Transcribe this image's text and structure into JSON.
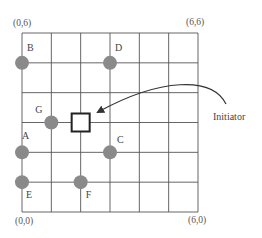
{
  "diagram": {
    "grid": {
      "cols": 6,
      "rows": 6,
      "left": 22,
      "top": 33,
      "right": 198,
      "bottom": 212,
      "line_color": "#555555"
    },
    "corners": {
      "top_left": "(0,6)",
      "top_right": "(6,6)",
      "bottom_left": "(0,0)",
      "bottom_right": "(6,0)"
    },
    "nodes": [
      {
        "label": "B",
        "x": 0,
        "y": 5
      },
      {
        "label": "D",
        "x": 3,
        "y": 5
      },
      {
        "label": "G",
        "x": 1,
        "y": 3
      },
      {
        "label": "A",
        "x": 0,
        "y": 2
      },
      {
        "label": "C",
        "x": 3,
        "y": 2
      },
      {
        "label": "E",
        "x": 0,
        "y": 1
      },
      {
        "label": "F",
        "x": 2,
        "y": 1
      }
    ],
    "node_color": "#8a8a8a",
    "initiator": {
      "label": "Initiator",
      "x": 2,
      "y": 3
    }
  }
}
